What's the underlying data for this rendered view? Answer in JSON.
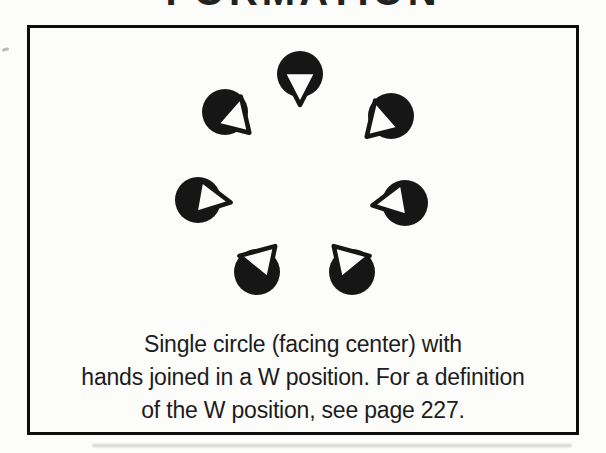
{
  "heading": {
    "text": "FORMATION"
  },
  "figure_box": {
    "caption": {
      "lines": [
        "Single circle (facing center) with",
        "hands joined in a W position. For a definition",
        "of the W position, see page 227."
      ]
    }
  },
  "diagram": {
    "type": "dance-formation",
    "dancer_count": 7,
    "circle_radius": 23,
    "colors": {
      "body": "#161616",
      "face": "#fcfcfa",
      "outline": "#161616"
    },
    "dancers": [
      {
        "position": "top",
        "facing": "center",
        "cx": 300,
        "cy": 74,
        "tx": 0,
        "ty": 11,
        "rot": 180
      },
      {
        "position": "upper-left",
        "facing": "center",
        "cx": 225,
        "cy": 112,
        "tx": 11,
        "ty": 4,
        "rot": 14
      },
      {
        "position": "upper-right",
        "facing": "center",
        "cx": 391,
        "cy": 116,
        "tx": -11,
        "ty": 4,
        "rot": -14
      },
      {
        "position": "mid-left",
        "facing": "center",
        "cx": 198,
        "cy": 200,
        "tx": 13,
        "ty": -1,
        "rot": 100
      },
      {
        "position": "mid-right",
        "facing": "center",
        "cx": 405,
        "cy": 203,
        "tx": -13,
        "ty": -1,
        "rot": -100
      },
      {
        "position": "bottom-left",
        "facing": "center",
        "cx": 257,
        "cy": 272,
        "tx": 2,
        "ty": -12,
        "rot": -78
      },
      {
        "position": "bottom-right",
        "facing": "center",
        "cx": 352,
        "cy": 272,
        "tx": -2,
        "ty": -12,
        "rot": 78
      }
    ]
  }
}
